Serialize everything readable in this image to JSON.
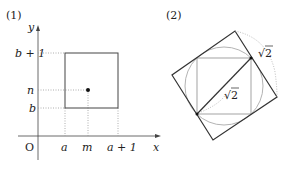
{
  "figure1": {
    "label": "(1)",
    "axes": {
      "x_label": "x",
      "y_label": "y",
      "origin": "O"
    },
    "y_ticks": [
      "b + 1",
      "n",
      "b"
    ],
    "x_ticks": [
      "a",
      "m",
      "a + 1"
    ],
    "square": {
      "x_from": "a",
      "x_to": "a+1",
      "y_from": "b",
      "y_to": "b+1"
    },
    "center_point": {
      "x": "m",
      "y": "n"
    }
  },
  "figure2": {
    "label": "(2)",
    "outer_square_label": "√2",
    "diagonal_label": "√2",
    "sqrt_symbol": "√",
    "sqrt_arg": "2"
  },
  "colors": {
    "line": "#333333",
    "light_line": "#aaaaaa",
    "dotted": "#999999"
  }
}
